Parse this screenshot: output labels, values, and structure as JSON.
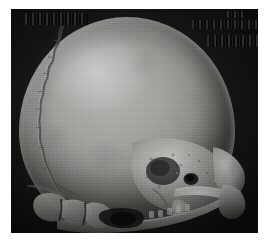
{
  "figure": {
    "kind": "medical-image",
    "modality": "CT",
    "rendering": "3D volume-rendered surface reconstruction",
    "anatomy": "human skull",
    "view": "lateral (side) projection, left-facing occiput, right-facing face",
    "caption": "",
    "background_color": "#161616",
    "page_background_color": "#ffffff",
    "bone_color": "#a2a29f",
    "bone_highlight_color": "#d7d7d5",
    "bone_shadow_color": "#5a5a56",
    "panel": {
      "x": 11,
      "y": 9,
      "width": 247,
      "height": 224,
      "border": "none",
      "noise": "film grain"
    },
    "structures": [
      {
        "name": "calvaria",
        "label": "cranial vault",
        "region": "upper two-thirds"
      },
      {
        "name": "frontal-bone",
        "label": "frontal bone",
        "region": "upper right"
      },
      {
        "name": "parietal-bone",
        "label": "parietal bone",
        "region": "upper center-left"
      },
      {
        "name": "occipital-bone",
        "label": "occipital bone",
        "region": "left posterior"
      },
      {
        "name": "coronal-suture",
        "label": "coronal suture",
        "region": "left parietal, dark wavy line"
      },
      {
        "name": "temporal-bone",
        "label": "temporal bone",
        "region": "lower right"
      },
      {
        "name": "squamous-temporal",
        "label": "squamous part of temporal bone",
        "region": "right mid"
      },
      {
        "name": "zygomatic-arch",
        "label": "zygomatic arch",
        "region": "lower right, bright bar"
      },
      {
        "name": "external-acoustic-meatus",
        "label": "external acoustic meatus",
        "region": "lower right"
      },
      {
        "name": "mastoid-process",
        "label": "mastoid process",
        "region": "lower right"
      },
      {
        "name": "mandible-ramus",
        "label": "mandibular ramus",
        "region": "bottom right"
      },
      {
        "name": "mandible-body",
        "label": "mandibular body",
        "region": "bottom center"
      },
      {
        "name": "cervical-vertebrae",
        "label": "cervical vertebrae",
        "region": "bottom left"
      },
      {
        "name": "orbit",
        "label": "orbital rim",
        "region": "far right"
      }
    ],
    "annotations": [
      {
        "id": "redact-tl",
        "position": "top-left",
        "state": "obscured",
        "text": ""
      },
      {
        "id": "redact-tr",
        "position": "top-right",
        "state": "obscured",
        "text": ""
      },
      {
        "id": "redact-tr2",
        "position": "top-right",
        "state": "obscured",
        "text": ""
      },
      {
        "id": "redact-tr3",
        "position": "top-right-corner",
        "state": "obscured",
        "text": ""
      }
    ]
  }
}
